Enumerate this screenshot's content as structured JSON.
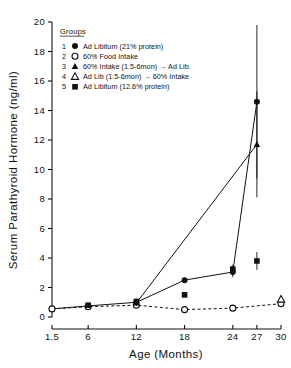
{
  "chart_data": {
    "type": "line",
    "title": "",
    "xlabel": "Age (Months)",
    "ylabel": "Serum Parathyroid Hormone (ng/ml)",
    "xlim": [
      1.5,
      30
    ],
    "ylim": [
      0,
      20
    ],
    "xticks": [
      1.5,
      6,
      12,
      18,
      24,
      27,
      30
    ],
    "xtick_labels": [
      "1.5",
      "6",
      "12",
      "18",
      "24",
      "27",
      "30"
    ],
    "yticks": [
      0,
      2,
      4,
      6,
      8,
      10,
      12,
      14,
      16,
      18,
      20
    ],
    "ytick_labels": [
      "0",
      "2",
      "4",
      "6",
      "8",
      "10",
      "12",
      "14",
      "16",
      "18",
      "20"
    ],
    "grid": false,
    "legend_position": "upper-left-inside",
    "legend_title": "Groups",
    "series": [
      {
        "number": "1",
        "name": "Ad Libitum (21% protein)",
        "marker": "filled-circle",
        "line": "solid",
        "points": [
          {
            "x": 1.5,
            "y": 0.55,
            "err": 0.08
          },
          {
            "x": 6,
            "y": 0.75,
            "err": 0.18
          },
          {
            "x": 12,
            "y": 1.0,
            "err": 0.25
          },
          {
            "x": 18,
            "y": 2.5,
            "err": 0.15
          },
          {
            "x": 24,
            "y": 3.05,
            "err": 0.35
          },
          {
            "x": 27,
            "y": 14.6,
            "err": 5.2
          }
        ]
      },
      {
        "number": "2",
        "name": "60% Food Intake",
        "marker": "open-circle",
        "line": "dashed",
        "points": [
          {
            "x": 1.5,
            "y": 0.55,
            "err": 0.06
          },
          {
            "x": 6,
            "y": 0.7,
            "err": 0.2
          },
          {
            "x": 12,
            "y": 0.8,
            "err": 0.2
          },
          {
            "x": 18,
            "y": 0.5,
            "err": 0.12
          },
          {
            "x": 24,
            "y": 0.6,
            "err": 0.2
          },
          {
            "x": 30,
            "y": 0.9,
            "err": 0.12
          }
        ]
      },
      {
        "number": "3",
        "name": "60% Intake (1.5-6mon) → Ad Lib.",
        "marker": "filled-triangle",
        "line": "solid",
        "points": [
          {
            "x": 12,
            "y": 0.95,
            "err": 0.2
          },
          {
            "x": 27,
            "y": 11.7,
            "err": 3.6
          }
        ]
      },
      {
        "number": "4",
        "name": "Ad Lib (1.5-6mon) → 60% Intake",
        "marker": "open-triangle",
        "line": "dashed",
        "points": [
          {
            "x": 30,
            "y": 1.2,
            "err": 0.1
          }
        ]
      },
      {
        "number": "5",
        "name": "Ad Libitum (12.6% protein)",
        "marker": "filled-square",
        "line": "none",
        "points": [
          {
            "x": 6,
            "y": 0.8,
            "err": 0.1
          },
          {
            "x": 12,
            "y": 1.05,
            "err": 0.15
          },
          {
            "x": 18,
            "y": 1.5,
            "err": 0.1
          },
          {
            "x": 24,
            "y": 3.25,
            "err": 0.3
          },
          {
            "x": 27,
            "y": 3.8,
            "err": 0.6
          }
        ]
      }
    ]
  },
  "colors": {
    "ink": "#111111",
    "background": "#ffffff"
  }
}
